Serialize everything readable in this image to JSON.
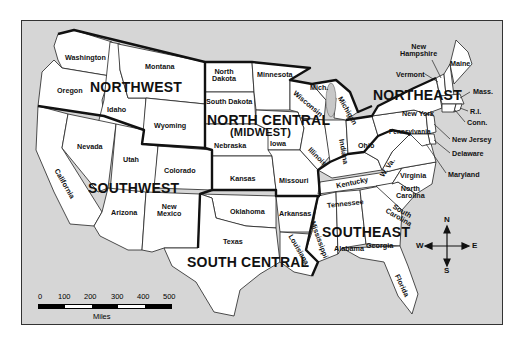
{
  "map": {
    "type": "regional map",
    "subject": "United States regions",
    "regions": [
      {
        "id": "northwest",
        "label": "NORTHWEST"
      },
      {
        "id": "north_central",
        "label": "NORTH CENTRAL",
        "sublabel": "(MIDWEST)"
      },
      {
        "id": "northeast",
        "label": "NORTHEAST"
      },
      {
        "id": "southwest",
        "label": "SOUTHWEST"
      },
      {
        "id": "south_central",
        "label": "SOUTH CENTRAL"
      },
      {
        "id": "southeast",
        "label": "SOUTHEAST"
      }
    ],
    "states": {
      "washington": "Washington",
      "oregon": "Oregon",
      "idaho": "Idaho",
      "montana": "Montana",
      "wyoming": "Wyoming",
      "california": "California",
      "nevada": "Nevada",
      "utah": "Utah",
      "colorado": "Colorado",
      "arizona": "Arizona",
      "new_mexico": "New\nMexico",
      "north_dakota": "North\nDakota",
      "south_dakota": "South Dakota",
      "nebraska": "Nebraska",
      "kansas": "Kansas",
      "minnesota": "Minnesota",
      "iowa": "Iowa",
      "missouri": "Missouri",
      "wisconsin": "Wisconsin",
      "illinois": "Illinois",
      "indiana": "Indiana",
      "michigan": "Michigan",
      "mich": "Mich.",
      "ohio": "Ohio",
      "oklahoma": "Oklahoma",
      "texas": "Texas",
      "arkansas": "Arkansas",
      "louisiana": "Louisiana",
      "kentucky": "Kentucky",
      "tennessee": "Tennessee",
      "mississippi": "Mississippi",
      "alabama": "Alabama",
      "georgia": "Georgia",
      "florida": "Florida",
      "south_carolina": "South\nCarolina",
      "north_carolina": "North\nCarolina",
      "virginia": "Virginia",
      "west_virginia": "W. Va.",
      "pennsylvania": "Pennsylvania",
      "new_york": "New York",
      "vermont": "Vermont",
      "new_hampshire": "New\nHampshire",
      "maine": "Maine",
      "massachusetts": "Mass.",
      "rhode_island": "R.I.",
      "connecticut": "Conn.",
      "new_jersey": "New Jersey",
      "delaware": "Delaware",
      "maryland": "Maryland"
    },
    "scale": {
      "ticks": [
        "0",
        "100",
        "200",
        "300",
        "400",
        "500"
      ],
      "unit": "Miles"
    },
    "compass": {
      "n": "N",
      "s": "S",
      "e": "E",
      "w": "W"
    },
    "colors": {
      "water": "#d6d6d6",
      "land": "#ffffff",
      "border": "#111111"
    }
  }
}
